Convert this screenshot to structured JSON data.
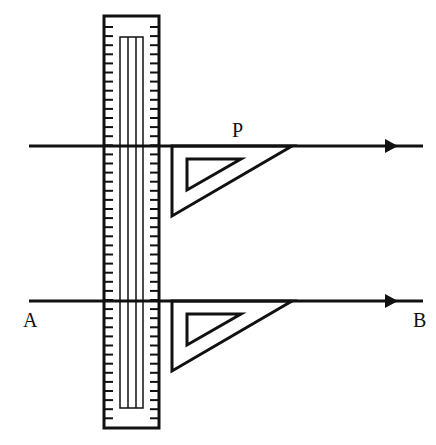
{
  "diagram": {
    "labels": {
      "point_p": "P",
      "point_a": "A",
      "point_b": "B"
    },
    "colors": {
      "stroke": "#111111",
      "background": "#ffffff"
    },
    "elements": {
      "ruler": "vertical ruler with tick marks",
      "set_square_top": "set square sliding along ruler at line through P",
      "set_square_bottom": "set square positioned on line AB",
      "line_through_p": "parallel line through P with arrow",
      "line_ab": "line AB with arrow"
    }
  }
}
